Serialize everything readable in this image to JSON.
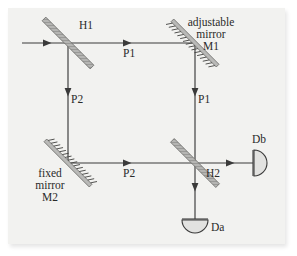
{
  "figure": {
    "kind": "optical-interferometer-diagram",
    "background_color": "#f2f2f0",
    "line_color": "#3a3a3a",
    "optic_color": "#9a9a9a",
    "labels": {
      "beamsplitter_1": "H1",
      "beamsplitter_2": "H2",
      "adjustable_mirror_line1": "adjustable",
      "adjustable_mirror_line2": "mirror",
      "adjustable_mirror_line3": "M1",
      "fixed_mirror_line1": "fixed",
      "fixed_mirror_line2": "mirror",
      "fixed_mirror_line3": "M2",
      "path_top": "P1",
      "path_left": "P2",
      "path_right": "P1",
      "path_bottom": "P2",
      "detector_a": "Da",
      "detector_b": "Db"
    },
    "components": [
      {
        "name": "H1",
        "type": "beam-splitter",
        "x": 68,
        "y": 43
      },
      {
        "name": "M1",
        "type": "adjustable-mirror",
        "x": 195,
        "y": 43
      },
      {
        "name": "M2",
        "type": "fixed-mirror",
        "x": 68,
        "y": 163
      },
      {
        "name": "H2",
        "type": "beam-splitter",
        "x": 195,
        "y": 163
      },
      {
        "name": "Da",
        "type": "detector",
        "x": 195,
        "y": 228
      },
      {
        "name": "Db",
        "type": "detector",
        "x": 263,
        "y": 163
      }
    ],
    "beams": [
      {
        "name": "input",
        "from": [
          22,
          43
        ],
        "to": [
          68,
          43
        ],
        "label": ""
      },
      {
        "name": "P1-top",
        "from": [
          68,
          43
        ],
        "to": [
          195,
          43
        ],
        "label": "P1"
      },
      {
        "name": "P2-left",
        "from": [
          68,
          43
        ],
        "to": [
          68,
          163
        ],
        "label": "P2"
      },
      {
        "name": "P1-right",
        "from": [
          195,
          43
        ],
        "to": [
          195,
          163
        ],
        "label": "P1"
      },
      {
        "name": "P2-bottom",
        "from": [
          68,
          163
        ],
        "to": [
          195,
          163
        ],
        "label": "P2"
      },
      {
        "name": "out-Db",
        "from": [
          195,
          163
        ],
        "to": [
          253,
          163
        ],
        "label": ""
      },
      {
        "name": "out-Da",
        "from": [
          195,
          163
        ],
        "to": [
          195,
          219
        ],
        "label": ""
      }
    ]
  }
}
